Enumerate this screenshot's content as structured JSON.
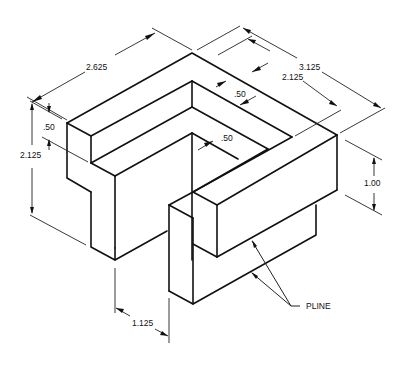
{
  "figure": {
    "colors": {
      "line": "#111111",
      "background": "#ffffff"
    }
  },
  "dimensions": {
    "overall_left_length": "2.625",
    "overall_right_length": "3.125",
    "inner_right_length": "2.125",
    "wall_thickness_top": ".50",
    "wall_thickness_inner": ".50",
    "left_wall_height": ".50",
    "overall_height": "2.125",
    "right_block_height": "1.00",
    "gap_width": "1.125"
  },
  "annotations": {
    "leader_label": "PLINE"
  }
}
